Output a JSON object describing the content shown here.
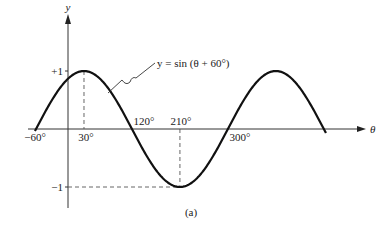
{
  "chart_data": {
    "type": "line",
    "title": "",
    "caption": "(a)",
    "function_label": "y = sin (θ + 60°)",
    "xlabel": "θ",
    "ylabel": "y",
    "function": {
      "amplitude": 1,
      "phase_deg": 60
    },
    "x_domain_deg": [
      -60,
      480
    ],
    "xlim_deg": [
      -70,
      560
    ],
    "ylim": [
      -1,
      1
    ],
    "grid": false,
    "x_tick_labels": [
      {
        "value": -60,
        "label": "−60°",
        "position": "below"
      },
      {
        "value": 30,
        "label": "30°",
        "position": "below"
      },
      {
        "value": 120,
        "label": "120°",
        "position": "above"
      },
      {
        "value": 210,
        "label": "210°",
        "position": "above"
      },
      {
        "value": 300,
        "label": "300°",
        "position": "below"
      }
    ],
    "y_tick_labels": [
      {
        "value": 1,
        "label": "+1"
      },
      {
        "value": -1,
        "label": "−1"
      }
    ],
    "key_points": [
      {
        "x": 30,
        "y": 1,
        "note": "maximum"
      },
      {
        "x": 210,
        "y": -1,
        "note": "minimum"
      },
      {
        "x": -60,
        "y": 0
      },
      {
        "x": 120,
        "y": 0
      },
      {
        "x": 300,
        "y": 0
      },
      {
        "x": 390,
        "y": 1,
        "note": "maximum"
      }
    ],
    "color": "#111111"
  }
}
